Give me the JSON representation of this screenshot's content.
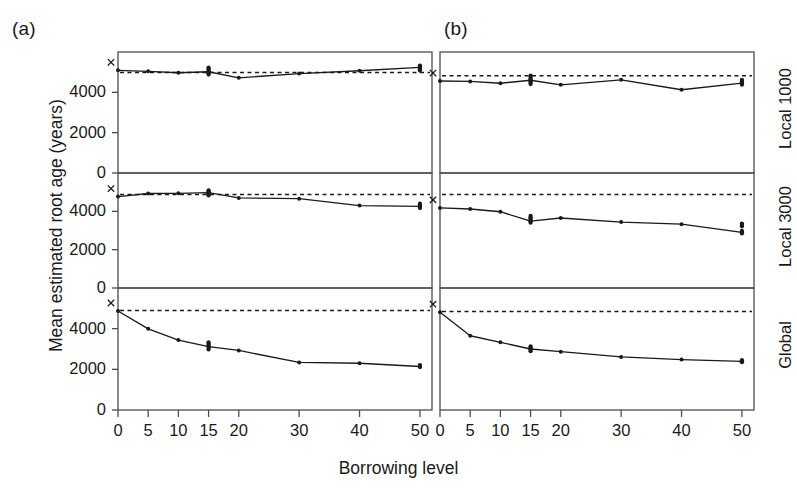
{
  "figure": {
    "panel_a_label": "(a)",
    "panel_b_label": "(b)",
    "ylabel": "Mean estimated root age (years)",
    "xlabel": "Borrowing level",
    "row_labels": [
      "Local 1000",
      "Local 3000",
      "Global"
    ],
    "line_color": "#1a1a1a",
    "reference_line_color": "#1a1a1a",
    "frame_color": "#4d4d4d"
  },
  "chart_data": {
    "type": "line",
    "title": "",
    "xlabel": "Borrowing level",
    "ylabel": "Mean estimated root age (years)",
    "xlim": [
      0,
      52
    ],
    "ylim": [
      0,
      6000
    ],
    "x_ticks": [
      0,
      5,
      10,
      15,
      20,
      30,
      40,
      50
    ],
    "x_tick_labels": [
      "0",
      "5",
      "10",
      "15",
      "20",
      "30",
      "40",
      "50"
    ],
    "y_ticks": [
      0,
      2000,
      4000
    ],
    "y_tick_labels": [
      "0",
      "2000",
      "4000"
    ],
    "grid": false,
    "legend": "none",
    "marker": "dot",
    "start_marker": "x",
    "columns": [
      "(a)",
      "(b)"
    ],
    "rows": [
      "Local 1000",
      "Local 3000",
      "Global"
    ],
    "panels": [
      {
        "column": "(a)",
        "row": "Local 1000",
        "reference_value": 4980,
        "x": [
          0,
          5,
          10,
          15,
          20,
          30,
          40,
          50
        ],
        "values": [
          5090,
          5040,
          4970,
          5020,
          4720,
          4930,
          5070,
          5240
        ],
        "jitter": {
          "15": [
            5230,
            5180,
            5120,
            5060,
            5010,
            4950,
            4880
          ],
          "50": [
            5330,
            5280,
            5230,
            5180,
            5130,
            5080
          ]
        }
      },
      {
        "column": "(a)",
        "row": "Local 3000",
        "reference_value": 4880,
        "x": [
          0,
          5,
          10,
          15,
          20,
          30,
          40,
          50
        ],
        "values": [
          4770,
          4930,
          4940,
          4980,
          4700,
          4660,
          4300,
          4260
        ],
        "jitter": {
          "15": [
            5100,
            5040,
            4990,
            4940,
            4880,
            4830
          ],
          "50": [
            4400,
            4340,
            4280,
            4220,
            4170
          ]
        }
      },
      {
        "column": "(a)",
        "row": "Global",
        "reference_value": 4890,
        "x": [
          0,
          5,
          10,
          15,
          20,
          30,
          40,
          50
        ],
        "values": [
          4870,
          3990,
          3440,
          3120,
          2930,
          2340,
          2300,
          2140
        ],
        "jitter": {
          "15": [
            3330,
            3260,
            3190,
            3120,
            3050,
            2980
          ],
          "50": [
            2210,
            2160,
            2110
          ]
        }
      },
      {
        "column": "(b)",
        "row": "Local 1000",
        "reference_value": 4820,
        "x": [
          0,
          5,
          10,
          15,
          20,
          30,
          40,
          50
        ],
        "values": [
          4560,
          4540,
          4450,
          4600,
          4370,
          4620,
          4130,
          4460
        ],
        "jitter": {
          "15": [
            4830,
            4760,
            4690,
            4620,
            4550,
            4480,
            4410
          ],
          "50": [
            4620,
            4560,
            4500,
            4440,
            4380
          ]
        }
      },
      {
        "column": "(b)",
        "row": "Local 3000",
        "reference_value": 4880,
        "x": [
          0,
          5,
          10,
          15,
          20,
          30,
          40,
          50
        ],
        "values": [
          4180,
          4120,
          3980,
          3490,
          3650,
          3440,
          3330,
          2900
        ],
        "jitter": {
          "15": [
            3760,
            3690,
            3620,
            3550,
            3480,
            3410
          ],
          "50": [
            3360,
            3290,
            3220,
            2980,
            2910,
            2850
          ]
        }
      },
      {
        "column": "(b)",
        "row": "Global",
        "reference_value": 4850,
        "x": [
          0,
          5,
          10,
          15,
          20,
          30,
          40,
          50
        ],
        "values": [
          4810,
          3650,
          3330,
          3000,
          2870,
          2610,
          2480,
          2390
        ],
        "jitter": {
          "15": [
            3130,
            3070,
            3010,
            2950,
            2890
          ],
          "50": [
            2450,
            2400,
            2350
          ]
        }
      }
    ]
  }
}
